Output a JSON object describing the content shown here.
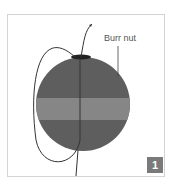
{
  "diagram": {
    "callout_label": "Burr nut",
    "step_badge": "1",
    "colors": {
      "sphere": "#5e5e5e",
      "band": "#868686",
      "top_cap": "#222222",
      "line": "#333333",
      "badge": "#7a7a7a",
      "frame": "#d4d4d4"
    }
  }
}
